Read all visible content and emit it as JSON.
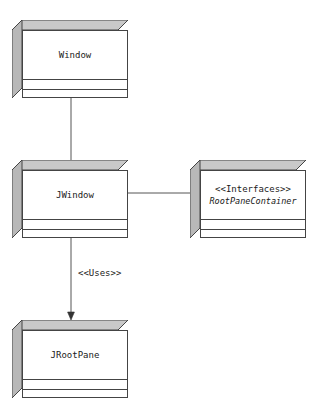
{
  "diagram": {
    "type": "uml-class-diagram",
    "background_color": "#ffffff",
    "line_color": "#444444",
    "face_shade_color": "#c9c9c9",
    "face_shade_color_dark": "#b3b3b3",
    "text_color": "#1a1a1a"
  },
  "classes": [
    {
      "id": "window",
      "name": "Window",
      "stereotype": "",
      "italic_name": false,
      "compartments": 3
    },
    {
      "id": "jwindow",
      "name": "JWindow",
      "stereotype": "",
      "italic_name": false,
      "compartments": 3
    },
    {
      "id": "rootpanecontainer",
      "name": "RootPaneContainer",
      "stereotype": "<<Interfaces>>",
      "italic_name": true,
      "compartments": 3
    },
    {
      "id": "jrootpane",
      "name": "JRootPane",
      "stereotype": "",
      "italic_name": false,
      "compartments": 3
    }
  ],
  "relations": [
    {
      "id": "generalization",
      "from": "jwindow",
      "to": "window",
      "label": "",
      "terminator": "filled-arrow"
    },
    {
      "id": "realization",
      "from": "jwindow",
      "to": "rootpanecontainer",
      "label": "",
      "terminator": "ball"
    },
    {
      "id": "uses",
      "from": "jwindow",
      "to": "jrootpane",
      "label": "<<Uses>>",
      "terminator": "filled-arrow"
    }
  ]
}
